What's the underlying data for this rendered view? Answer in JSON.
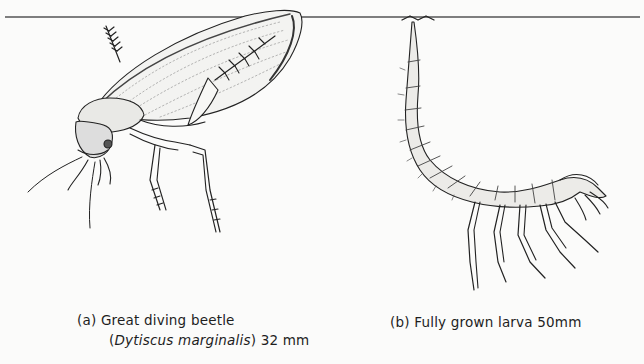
{
  "figure": {
    "panels": [
      {
        "id": "a",
        "subject": "great-diving-beetle",
        "caption": {
          "label": "(a)",
          "title": "Great diving beetle",
          "open_paren": "(",
          "scientific_name": "Dytiscus marginalis",
          "close_paren": ")",
          "size": "32 mm"
        }
      },
      {
        "id": "b",
        "subject": "diving-beetle-larva",
        "caption": {
          "label": "(b)",
          "title": "Fully grown larva",
          "size": "50mm"
        }
      }
    ],
    "water_surface": {
      "color": "#555555"
    }
  }
}
